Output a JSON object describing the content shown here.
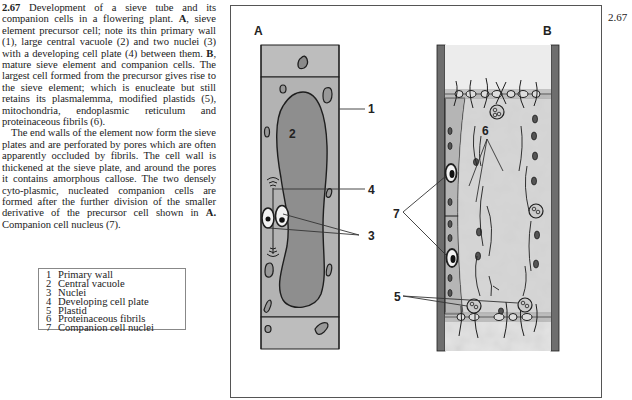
{
  "caption": {
    "figure_number": "2.67",
    "paragraph1": {
      "lead": "2.67",
      "text_a": " Development of a sieve tube and its companion cells in a flowering plant. ",
      "bold_a": "A",
      "text_b": ", sieve element precursor cell; note its thin primary wall (1), large central vacuole (2) and two nuclei (3) with a developing cell plate (4) between them. ",
      "bold_b": "B",
      "text_c": ", mature sieve element and companion cells. The largest cell formed from the precursor gives rise to the sieve element; which is enucleate but still retains its plasmalemma, modified plastids (5), mitochondria, endoplasmic reticulum and proteinaceous fibrils (6)."
    },
    "paragraph2": {
      "text_a": "The end walls of the element now form the sieve plates and are perforated by pores which are often apparently occluded by fibrils. The cell wall is thickened at the sieve plate, and around the pores it contains amorphous callose. The two densely cyto-plasmic, nucleated companion cells are formed after the further division of the smaller derivative of the precursor cell shown in ",
      "bold_a": "A.",
      "text_b": " Companion cell nucleus (7)."
    }
  },
  "legend": [
    {
      "num": "1",
      "label": "Primary wall"
    },
    {
      "num": "2",
      "label": "Central vacuole"
    },
    {
      "num": "3",
      "label": "Nuclei"
    },
    {
      "num": "4",
      "label": "Developing cell plate"
    },
    {
      "num": "5",
      "label": "Plastid"
    },
    {
      "num": "6",
      "label": "Proteinaceous fibrils"
    },
    {
      "num": "7",
      "label": "Companion cell nuclei"
    }
  ],
  "figure": {
    "number": "2.67",
    "panel_a": {
      "label": "A",
      "callouts": {
        "c1": "1",
        "c2": "2",
        "c3": "3",
        "c4": "4"
      }
    },
    "panel_b": {
      "label": "B",
      "callouts": {
        "c5": "5",
        "c6": "6",
        "c7": "7"
      }
    },
    "colors": {
      "cytoplasm": "#b4b4b4",
      "vacuole": "#8e8e8e",
      "end_cell": "#bdbdbd",
      "wall": "#6e6e6e",
      "lumen": "#e2e2e2",
      "ink": "#1e1e1e"
    }
  }
}
